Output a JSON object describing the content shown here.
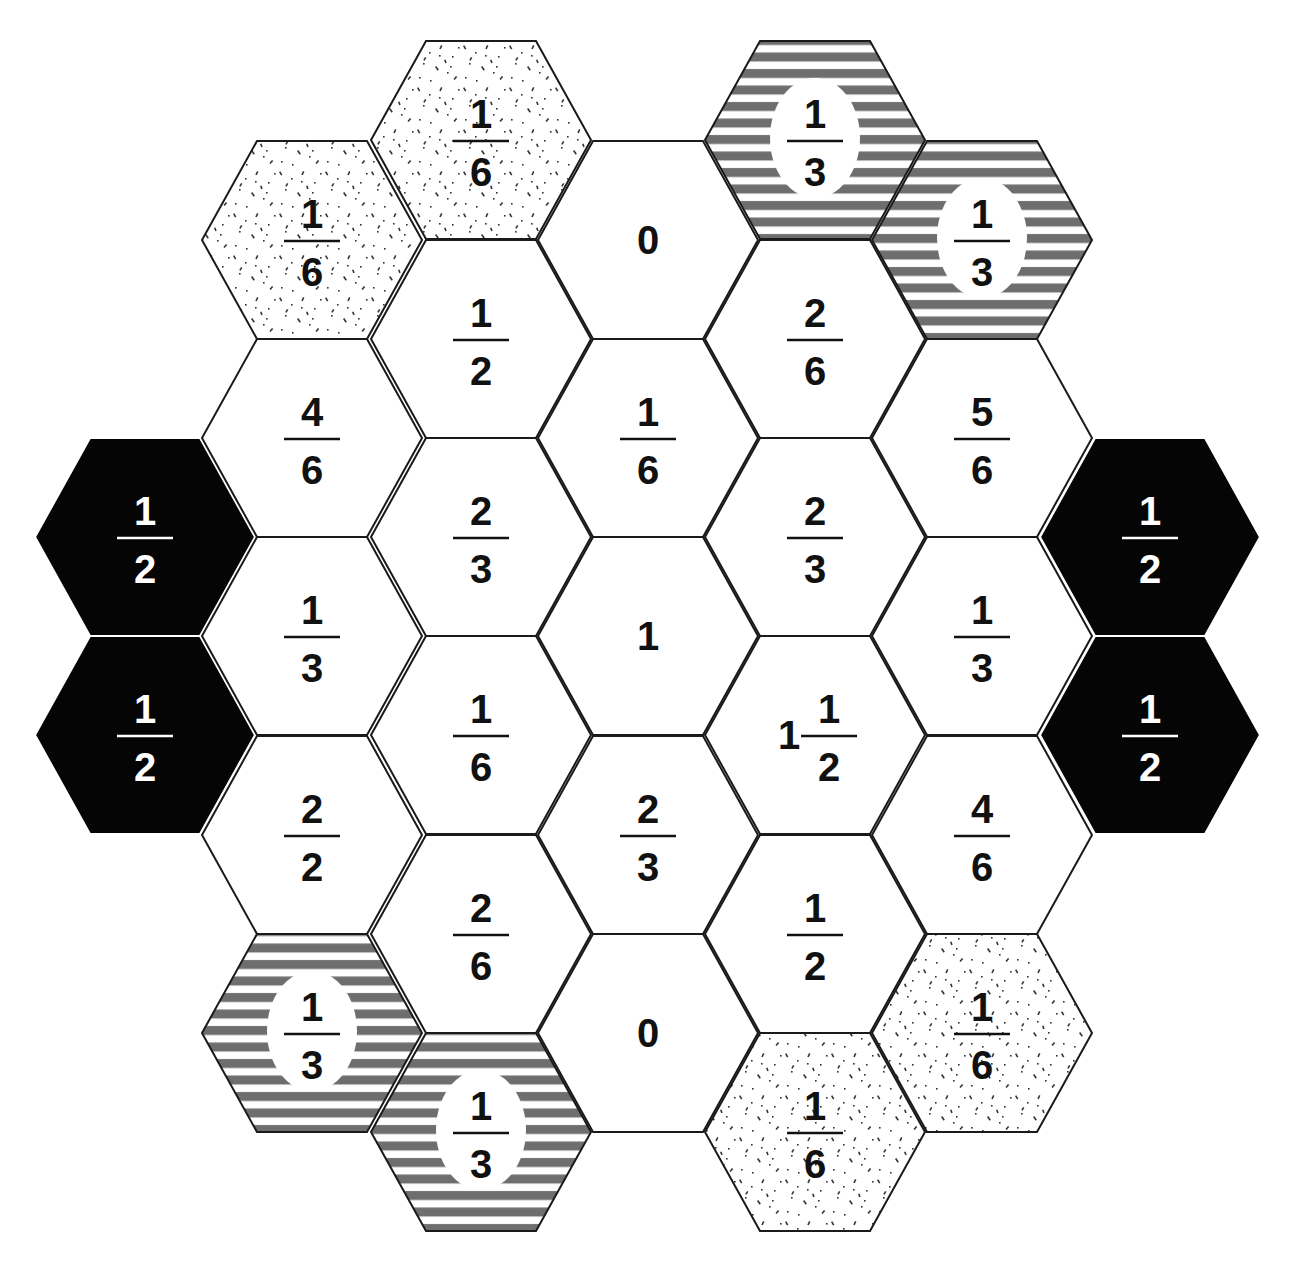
{
  "puzzle": {
    "type": "hexagon fraction board",
    "colors": {
      "outline": "#1a1a1a",
      "black_fill": "#050505",
      "stripe": "#6e6e6e",
      "stipple_dot": "#333333",
      "plain_fill": "#ffffff"
    },
    "geometry": {
      "radius": 110,
      "half_height": 99,
      "col_step": 167
    },
    "cells": [
      {
        "id": "c0r0",
        "col": 0,
        "cx": 145,
        "cy": 537,
        "style": "black",
        "whole": "",
        "num": "1",
        "den": "2"
      },
      {
        "id": "c0r1",
        "col": 0,
        "cx": 145,
        "cy": 735,
        "style": "black",
        "whole": "",
        "num": "1",
        "den": "2"
      },
      {
        "id": "c1r0",
        "col": 1,
        "cx": 312,
        "cy": 240,
        "style": "stipple",
        "whole": "",
        "num": "1",
        "den": "6"
      },
      {
        "id": "c1r1",
        "col": 1,
        "cx": 312,
        "cy": 438,
        "style": "plain",
        "whole": "",
        "num": "4",
        "den": "6"
      },
      {
        "id": "c1r2",
        "col": 1,
        "cx": 312,
        "cy": 636,
        "style": "plain",
        "whole": "",
        "num": "1",
        "den": "3"
      },
      {
        "id": "c1r3",
        "col": 1,
        "cx": 312,
        "cy": 835,
        "style": "plain",
        "whole": "",
        "num": "2",
        "den": "2"
      },
      {
        "id": "c1r4",
        "col": 1,
        "cx": 312,
        "cy": 1033,
        "style": "striped",
        "whole": "",
        "num": "1",
        "den": "3"
      },
      {
        "id": "c2r0",
        "col": 2,
        "cx": 481,
        "cy": 140,
        "style": "stipple",
        "whole": "",
        "num": "1",
        "den": "6"
      },
      {
        "id": "c2r1",
        "col": 2,
        "cx": 481,
        "cy": 339,
        "style": "plain",
        "whole": "",
        "num": "1",
        "den": "2"
      },
      {
        "id": "c2r2",
        "col": 2,
        "cx": 481,
        "cy": 537,
        "style": "plain",
        "whole": "",
        "num": "2",
        "den": "3"
      },
      {
        "id": "c2r3",
        "col": 2,
        "cx": 481,
        "cy": 735,
        "style": "plain",
        "whole": "",
        "num": "1",
        "den": "6"
      },
      {
        "id": "c2r4",
        "col": 2,
        "cx": 481,
        "cy": 934,
        "style": "plain",
        "whole": "",
        "num": "2",
        "den": "6"
      },
      {
        "id": "c2r5",
        "col": 2,
        "cx": 481,
        "cy": 1132,
        "style": "striped",
        "whole": "",
        "num": "1",
        "den": "3"
      },
      {
        "id": "c3r0",
        "col": 3,
        "cx": 648,
        "cy": 240,
        "style": "plain",
        "whole": "0",
        "num": "",
        "den": ""
      },
      {
        "id": "c3r1",
        "col": 3,
        "cx": 648,
        "cy": 438,
        "style": "plain",
        "whole": "",
        "num": "1",
        "den": "6"
      },
      {
        "id": "c3r2",
        "col": 3,
        "cx": 648,
        "cy": 636,
        "style": "plain",
        "whole": "1",
        "num": "",
        "den": ""
      },
      {
        "id": "c3r3",
        "col": 3,
        "cx": 648,
        "cy": 835,
        "style": "plain",
        "whole": "",
        "num": "2",
        "den": "3"
      },
      {
        "id": "c3r4",
        "col": 3,
        "cx": 648,
        "cy": 1033,
        "style": "plain",
        "whole": "0",
        "num": "",
        "den": ""
      },
      {
        "id": "c4r0",
        "col": 4,
        "cx": 815,
        "cy": 140,
        "style": "striped",
        "whole": "",
        "num": "1",
        "den": "3"
      },
      {
        "id": "c4r1",
        "col": 4,
        "cx": 815,
        "cy": 339,
        "style": "plain",
        "whole": "",
        "num": "2",
        "den": "6"
      },
      {
        "id": "c4r2",
        "col": 4,
        "cx": 815,
        "cy": 537,
        "style": "plain",
        "whole": "",
        "num": "2",
        "den": "3"
      },
      {
        "id": "c4r3",
        "col": 4,
        "cx": 815,
        "cy": 735,
        "style": "plain",
        "whole": "1",
        "num": "1",
        "den": "2"
      },
      {
        "id": "c4r4",
        "col": 4,
        "cx": 815,
        "cy": 934,
        "style": "plain",
        "whole": "",
        "num": "1",
        "den": "2"
      },
      {
        "id": "c4r5",
        "col": 4,
        "cx": 815,
        "cy": 1132,
        "style": "stipple",
        "whole": "",
        "num": "1",
        "den": "6"
      },
      {
        "id": "c5r0",
        "col": 5,
        "cx": 982,
        "cy": 240,
        "style": "striped",
        "whole": "",
        "num": "1",
        "den": "3"
      },
      {
        "id": "c5r1",
        "col": 5,
        "cx": 982,
        "cy": 438,
        "style": "plain",
        "whole": "",
        "num": "5",
        "den": "6"
      },
      {
        "id": "c5r2",
        "col": 5,
        "cx": 982,
        "cy": 636,
        "style": "plain",
        "whole": "",
        "num": "1",
        "den": "3"
      },
      {
        "id": "c5r3",
        "col": 5,
        "cx": 982,
        "cy": 835,
        "style": "plain",
        "whole": "",
        "num": "4",
        "den": "6"
      },
      {
        "id": "c5r4",
        "col": 5,
        "cx": 982,
        "cy": 1033,
        "style": "stipple",
        "whole": "",
        "num": "1",
        "den": "6"
      },
      {
        "id": "c6r0",
        "col": 6,
        "cx": 1150,
        "cy": 537,
        "style": "black",
        "whole": "",
        "num": "1",
        "den": "2"
      },
      {
        "id": "c6r1",
        "col": 6,
        "cx": 1150,
        "cy": 735,
        "style": "black",
        "whole": "",
        "num": "1",
        "den": "2"
      }
    ]
  }
}
